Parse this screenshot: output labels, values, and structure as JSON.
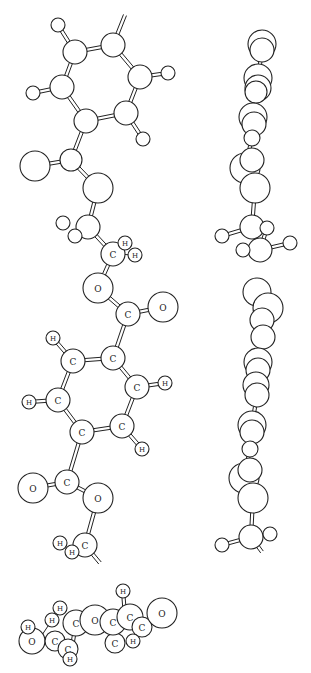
{
  "figure": {
    "type": "ball-and-stick molecular model, three projections",
    "views": [
      "front view",
      "side view",
      "end view"
    ]
  },
  "front_view": {
    "atoms": [
      {
        "id": "r1",
        "el": "",
        "x": 75,
        "y": 52,
        "r": 12
      },
      {
        "id": "r2",
        "el": "",
        "x": 113,
        "y": 45,
        "r": 12
      },
      {
        "id": "r3",
        "el": "",
        "x": 140,
        "y": 77,
        "r": 12
      },
      {
        "id": "r4",
        "el": "",
        "x": 126,
        "y": 113,
        "r": 12
      },
      {
        "id": "r5",
        "el": "",
        "x": 86,
        "y": 121,
        "r": 12
      },
      {
        "id": "r6",
        "el": "",
        "x": 62,
        "y": 87,
        "r": 12
      },
      {
        "id": "h1",
        "el": "",
        "x": 58,
        "y": 25,
        "r": 7
      },
      {
        "id": "h2",
        "el": "",
        "x": 168,
        "y": 73,
        "r": 7
      },
      {
        "id": "h3",
        "el": "",
        "x": 143,
        "y": 139,
        "r": 7
      },
      {
        "id": "h4",
        "el": "",
        "x": 33,
        "y": 93,
        "r": 7
      },
      {
        "id": "c1",
        "el": "",
        "x": 71,
        "y": 160,
        "r": 11
      },
      {
        "id": "o1",
        "el": "",
        "x": 35,
        "y": 166,
        "r": 15
      },
      {
        "id": "o2",
        "el": "",
        "x": 98,
        "y": 188,
        "r": 15
      },
      {
        "id": "c2",
        "el": "",
        "x": 88,
        "y": 227,
        "r": 12
      },
      {
        "id": "h5",
        "el": "",
        "x": 63,
        "y": 223,
        "r": 7
      },
      {
        "id": "h6",
        "el": "",
        "x": 75,
        "y": 236,
        "r": 7
      },
      {
        "id": "c3",
        "el": "C",
        "x": 113,
        "y": 254,
        "r": 12
      },
      {
        "id": "h7",
        "el": "H",
        "x": 125,
        "y": 243,
        "r": 7
      },
      {
        "id": "h8",
        "el": "H",
        "x": 135,
        "y": 255,
        "r": 7
      },
      {
        "id": "o3",
        "el": "O",
        "x": 98,
        "y": 288,
        "r": 15
      },
      {
        "id": "c4",
        "el": "C",
        "x": 128,
        "y": 314,
        "r": 12
      },
      {
        "id": "o4",
        "el": "O",
        "x": 163,
        "y": 307,
        "r": 15
      },
      {
        "id": "c5",
        "el": "C",
        "x": 113,
        "y": 358,
        "r": 12
      },
      {
        "id": "c6",
        "el": "C",
        "x": 73,
        "y": 361,
        "r": 12
      },
      {
        "id": "h9",
        "el": "H",
        "x": 53,
        "y": 338,
        "r": 7
      },
      {
        "id": "c7",
        "el": "C",
        "x": 58,
        "y": 400,
        "r": 12
      },
      {
        "id": "h10",
        "el": "H",
        "x": 29,
        "y": 402,
        "r": 7
      },
      {
        "id": "c8",
        "el": "C",
        "x": 82,
        "y": 432,
        "r": 12
      },
      {
        "id": "c9",
        "el": "C",
        "x": 122,
        "y": 426,
        "r": 12
      },
      {
        "id": "c10",
        "el": "C",
        "x": 137,
        "y": 387,
        "r": 12
      },
      {
        "id": "h11",
        "el": "H",
        "x": 165,
        "y": 383,
        "r": 7
      },
      {
        "id": "h12",
        "el": "H",
        "x": 142,
        "y": 449,
        "r": 7
      },
      {
        "id": "c11",
        "el": "C",
        "x": 67,
        "y": 482,
        "r": 12
      },
      {
        "id": "o5",
        "el": "O",
        "x": 33,
        "y": 488,
        "r": 15
      },
      {
        "id": "o6",
        "el": "O",
        "x": 98,
        "y": 498,
        "r": 15
      },
      {
        "id": "c12",
        "el": "C",
        "x": 85,
        "y": 545,
        "r": 12
      },
      {
        "id": "h13",
        "el": "H",
        "x": 60,
        "y": 543,
        "r": 7
      },
      {
        "id": "h14",
        "el": "H",
        "x": 72,
        "y": 552,
        "r": 7
      }
    ],
    "bonds": [
      [
        "r1",
        "r2",
        2
      ],
      [
        "r2",
        "r3",
        2
      ],
      [
        "r3",
        "r4",
        2
      ],
      [
        "r4",
        "r5",
        2
      ],
      [
        "r5",
        "r6",
        2
      ],
      [
        "r6",
        "r1",
        2
      ],
      [
        "r1",
        "h1",
        2
      ],
      [
        "r3",
        "h2",
        2
      ],
      [
        "r4",
        "h3",
        2
      ],
      [
        "r6",
        "h4",
        2
      ],
      [
        "r5",
        "c1",
        2
      ],
      [
        "c1",
        "o1",
        2
      ],
      [
        "c1",
        "o2",
        2
      ],
      [
        "o2",
        "c2",
        2
      ],
      [
        "c2",
        "c3",
        2
      ],
      [
        "c3",
        "h7",
        1
      ],
      [
        "c3",
        "h8",
        1
      ],
      [
        "c3",
        "o3",
        2
      ],
      [
        "o3",
        "c4",
        2
      ],
      [
        "c4",
        "o4",
        2
      ],
      [
        "c4",
        "c5",
        2
      ],
      [
        "c5",
        "c6",
        2
      ],
      [
        "c6",
        "h9",
        2
      ],
      [
        "c6",
        "c7",
        2
      ],
      [
        "c7",
        "h10",
        2
      ],
      [
        "c7",
        "c8",
        2
      ],
      [
        "c8",
        "c9",
        2
      ],
      [
        "c9",
        "c10",
        2
      ],
      [
        "c10",
        "c5",
        2
      ],
      [
        "c10",
        "h11",
        2
      ],
      [
        "c9",
        "h12",
        2
      ],
      [
        "c8",
        "c11",
        2
      ],
      [
        "c11",
        "o5",
        2
      ],
      [
        "c11",
        "o6",
        2
      ],
      [
        "o6",
        "c12",
        2
      ]
    ],
    "stubs": [
      {
        "from": "r2",
        "x2": 125,
        "y2": 15
      },
      {
        "from": "c12",
        "x2": 100,
        "y2": 563
      }
    ]
  },
  "side_view": {
    "atoms": [
      {
        "x": 262,
        "y": 44,
        "r": 14
      },
      {
        "x": 262,
        "y": 50,
        "r": 12
      },
      {
        "x": 258,
        "y": 78,
        "r": 14
      },
      {
        "x": 258,
        "y": 88,
        "r": 13
      },
      {
        "x": 256,
        "y": 92,
        "r": 11
      },
      {
        "x": 253,
        "y": 117,
        "r": 14
      },
      {
        "x": 254,
        "y": 124,
        "r": 12
      },
      {
        "x": 252,
        "y": 138,
        "r": 8
      },
      {
        "x": 245,
        "y": 168,
        "r": 15
      },
      {
        "x": 252,
        "y": 160,
        "r": 12
      },
      {
        "x": 255,
        "y": 188,
        "r": 15
      },
      {
        "x": 252,
        "y": 227,
        "r": 12
      },
      {
        "x": 222,
        "y": 236,
        "r": 7
      },
      {
        "x": 267,
        "y": 228,
        "r": 7
      },
      {
        "x": 260,
        "y": 250,
        "r": 12
      },
      {
        "x": 243,
        "y": 250,
        "r": 7
      },
      {
        "x": 290,
        "y": 243,
        "r": 7
      },
      {
        "x": 257,
        "y": 292,
        "r": 14
      },
      {
        "x": 268,
        "y": 308,
        "r": 15
      },
      {
        "x": 262,
        "y": 320,
        "r": 12
      },
      {
        "x": 263,
        "y": 337,
        "r": 12
      },
      {
        "x": 258,
        "y": 362,
        "r": 14
      },
      {
        "x": 258,
        "y": 370,
        "r": 12
      },
      {
        "x": 256,
        "y": 385,
        "r": 13
      },
      {
        "x": 257,
        "y": 395,
        "r": 12
      },
      {
        "x": 252,
        "y": 425,
        "r": 14
      },
      {
        "x": 252,
        "y": 432,
        "r": 12
      },
      {
        "x": 250,
        "y": 449,
        "r": 8
      },
      {
        "x": 244,
        "y": 478,
        "r": 15
      },
      {
        "x": 250,
        "y": 470,
        "r": 12
      },
      {
        "x": 253,
        "y": 498,
        "r": 15
      },
      {
        "x": 251,
        "y": 537,
        "r": 12
      },
      {
        "x": 222,
        "y": 545,
        "r": 7
      },
      {
        "x": 270,
        "y": 534,
        "r": 7
      }
    ]
  },
  "end_view": {
    "atoms": [
      {
        "el": "O",
        "x": 32,
        "y": 641,
        "r": 13
      },
      {
        "el": "H",
        "x": 28,
        "y": 627,
        "r": 7
      },
      {
        "el": "H",
        "x": 60,
        "y": 608,
        "r": 7
      },
      {
        "el": "H",
        "x": 52,
        "y": 620,
        "r": 7
      },
      {
        "el": "C",
        "x": 55,
        "y": 641,
        "r": 10
      },
      {
        "el": "C",
        "x": 68,
        "y": 649,
        "r": 10
      },
      {
        "el": "C",
        "x": 76,
        "y": 623,
        "r": 13
      },
      {
        "el": "H",
        "x": 70,
        "y": 659,
        "r": 7
      },
      {
        "el": "O",
        "x": 95,
        "y": 620,
        "r": 15
      },
      {
        "el": "C",
        "x": 115,
        "y": 643,
        "r": 10
      },
      {
        "el": "C",
        "x": 113,
        "y": 622,
        "r": 13
      },
      {
        "el": "H",
        "x": 123,
        "y": 591,
        "r": 7
      },
      {
        "el": "C",
        "x": 130,
        "y": 617,
        "r": 13
      },
      {
        "el": "C",
        "x": 142,
        "y": 627,
        "r": 10
      },
      {
        "el": "H",
        "x": 133,
        "y": 641,
        "r": 7
      },
      {
        "el": "O",
        "x": 162,
        "y": 613,
        "r": 15
      }
    ]
  }
}
